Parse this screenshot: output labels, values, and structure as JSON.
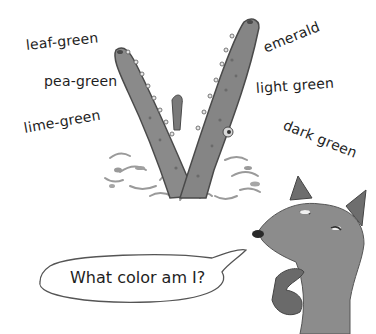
{
  "scene": {
    "description": "Illustration: a crocodile snout rising from splashing water, a fox asking a question",
    "palette": {
      "background": "#ffffff",
      "ink": "#1e1e1e",
      "croc_fill": "#8a8a8a",
      "croc_dark": "#5e5e5e",
      "fox_fill": "#8c8c8c",
      "splash": "#b5b5b5"
    }
  },
  "color_words": {
    "left": [
      {
        "label": "leaf-green"
      },
      {
        "label": "pea-green"
      },
      {
        "label": "lime-green"
      }
    ],
    "right": [
      {
        "label": "emerald"
      },
      {
        "label": "light green"
      },
      {
        "label": "dark green"
      }
    ]
  },
  "speech_bubble": {
    "text": "What color am I?"
  },
  "characters": {
    "crocodile": "crocodile-snout",
    "fox": "fox"
  }
}
